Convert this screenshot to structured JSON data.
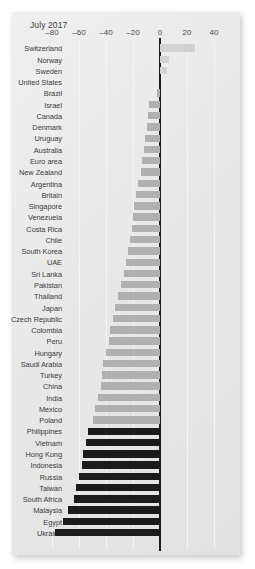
{
  "chart": {
    "title": "July 2017",
    "axis": {
      "ticks": [
        -80,
        -60,
        -40,
        -20,
        0,
        20,
        40
      ],
      "tick_labels": [
        "–80",
        "–60",
        "–40",
        "–20",
        "0",
        "20",
        "40"
      ]
    },
    "colors": {
      "positive_bar": "#d2d2d2",
      "negative_bar": "#b0b0b0",
      "dark_bar": "#1b1b1b",
      "zero_line": "#1c1c1c",
      "panel_background": "#e9e9e9",
      "gridline": "#f4f4f4",
      "label_text": "#3a3a3a"
    }
  },
  "chart_data": {
    "type": "bar",
    "orientation": "horizontal",
    "title": "July 2017",
    "xlabel": "",
    "ylabel": "",
    "xlim": [
      -90,
      48
    ],
    "grid": true,
    "legend": null,
    "categories": [
      "Switzerland",
      "Norway",
      "Sweden",
      "United States",
      "Brazil",
      "Israel",
      "Canada",
      "Denmark",
      "Uruguay",
      "Australia",
      "Euro area",
      "New Zealand",
      "Argentina",
      "Britain",
      "Singapore",
      "Venezuela",
      "Costa Rica",
      "Chile",
      "South Korea",
      "UAE",
      "Sri Lanka",
      "Pakistan",
      "Thailand",
      "Japan",
      "Czech Republic",
      "Colombia",
      "Peru",
      "Hungary",
      "Saudi Arabia",
      "Turkey",
      "China",
      "India",
      "Mexico",
      "Poland",
      "Philippines",
      "Vietnam",
      "Hong Kong",
      "Indonesia",
      "Russia",
      "Taiwan",
      "South Africa",
      "Malaysia",
      "Egypt",
      "Ukraine"
    ],
    "values": [
      26,
      7,
      5,
      0,
      -2,
      -8,
      -9,
      -10,
      -11,
      -12,
      -13,
      -14,
      -16,
      -18,
      -19,
      -20,
      -21,
      -22,
      -24,
      -25,
      -27,
      -29,
      -31,
      -33,
      -35,
      -37,
      -38,
      -40,
      -42,
      -43,
      -44,
      -46,
      -48,
      -50,
      -53,
      -55,
      -57,
      -58,
      -60,
      -62,
      -64,
      -68,
      -72,
      -78
    ],
    "bar_styles": [
      "pos",
      "pos",
      "pos",
      "pos",
      "neg",
      "neg",
      "neg",
      "neg",
      "neg",
      "neg",
      "neg",
      "neg",
      "neg",
      "neg",
      "neg",
      "neg",
      "neg",
      "neg",
      "neg",
      "neg",
      "neg",
      "neg",
      "neg",
      "neg",
      "neg",
      "neg",
      "neg",
      "neg",
      "neg",
      "neg",
      "neg",
      "neg",
      "neg",
      "neg",
      "dark",
      "dark",
      "dark",
      "dark",
      "dark",
      "dark",
      "dark",
      "dark",
      "dark",
      "dark"
    ]
  }
}
